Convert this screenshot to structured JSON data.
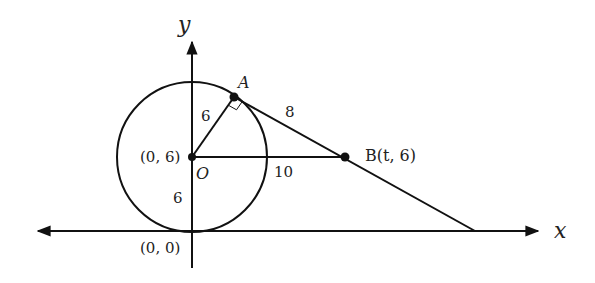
{
  "axes": {
    "x_label": "x",
    "y_label": "y"
  },
  "points": {
    "center": {
      "name": "O",
      "coord": "(0, 6)"
    },
    "origin": {
      "coord": "(0, 0)"
    },
    "tangent_point": {
      "name": "A"
    },
    "external_point": {
      "label": "B(t, 6)"
    }
  },
  "segments": {
    "OA": "6",
    "AB": "8",
    "OB": "10",
    "origin_to_center": "6"
  },
  "colors": {
    "stroke": "#111111",
    "background": "#ffffff"
  }
}
